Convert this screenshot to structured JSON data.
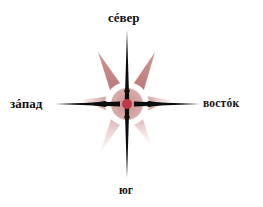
{
  "compass": {
    "labels": {
      "north": "сéвер",
      "west": "зáпад",
      "east": "востóк",
      "south": "юг"
    },
    "colors": {
      "needle": "#0d0d0d",
      "petal": "#b8706e",
      "petal_light": "#e3c2c0",
      "ring": "#d4a3a2",
      "center_dot": "#c0394a",
      "label": "#111111"
    }
  }
}
